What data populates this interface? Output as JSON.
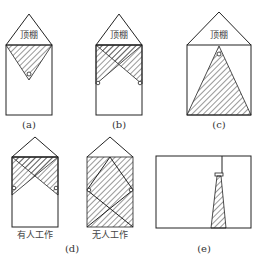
{
  "diagram": {
    "ceiling_label": "顶棚",
    "panels": [
      {
        "id": "a",
        "caption": "(a)",
        "description": "Single lamp at center, inverted triangle illumination"
      },
      {
        "id": "b",
        "caption": "(b)",
        "description": "Two wall lamps, crossing triangles"
      },
      {
        "id": "c",
        "caption": "(c)",
        "description": "Ceiling lamp, upright triangle illumination to floor"
      },
      {
        "id": "d",
        "caption": "(d)",
        "sub_captions": [
          "有人工作",
          "无人工作"
        ],
        "description": "Occupied vs unoccupied working"
      },
      {
        "id": "e",
        "caption": "(e)",
        "description": "Pendant lamp with narrow beam"
      }
    ]
  }
}
